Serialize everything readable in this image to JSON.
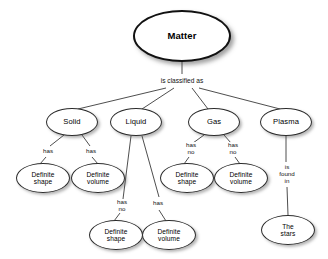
{
  "diagram": {
    "background_color": "#ffffff",
    "node_border_color": "#2b2b2b",
    "text_color": "#000000"
  },
  "nodes": {
    "root": {
      "label": "Matter",
      "cx": 182,
      "cy": 36,
      "rx": 49,
      "ry": 26
    },
    "states": [
      {
        "key": "solid",
        "label": "Solid",
        "cx": 72,
        "cy": 122,
        "rx": 26,
        "ry": 14
      },
      {
        "key": "liquid",
        "label": "Liquid",
        "cx": 136,
        "cy": 122,
        "rx": 26,
        "ry": 14
      },
      {
        "key": "gas",
        "label": "Gas",
        "cx": 214,
        "cy": 122,
        "rx": 26,
        "ry": 14
      },
      {
        "key": "plasma",
        "label": "Plasma",
        "cx": 286,
        "cy": 122,
        "rx": 26,
        "ry": 14
      }
    ],
    "properties": [
      {
        "key": "solid-shape",
        "label": "Definite\nshape",
        "cx": 43,
        "cy": 178,
        "rx": 27,
        "ry": 15
      },
      {
        "key": "solid-volume",
        "label": "Definite\nvolume",
        "cx": 98,
        "cy": 178,
        "rx": 27,
        "ry": 15
      },
      {
        "key": "gas-shape",
        "label": "Definite\nshape",
        "cx": 187,
        "cy": 178,
        "rx": 27,
        "ry": 15
      },
      {
        "key": "gas-volume",
        "label": "Definite\nvolume",
        "cx": 241,
        "cy": 178,
        "rx": 27,
        "ry": 15
      },
      {
        "key": "liquid-shape",
        "label": "Definite\nshape",
        "cx": 116,
        "cy": 235,
        "rx": 27,
        "ry": 15
      },
      {
        "key": "liquid-volume",
        "label": "Definite\nvolume",
        "cx": 169,
        "cy": 235,
        "rx": 27,
        "ry": 15
      },
      {
        "key": "the-stars",
        "label": "The\nstars",
        "cx": 288,
        "cy": 230,
        "rx": 27,
        "ry": 15
      }
    ]
  },
  "edge_labels": [
    {
      "key": "classified",
      "text": "is classified as",
      "x": 182,
      "y": 81
    },
    {
      "key": "solid-has-1",
      "text": "has",
      "x": 48,
      "y": 151
    },
    {
      "key": "solid-has-2",
      "text": "has",
      "x": 91,
      "y": 151
    },
    {
      "key": "gas-hasno-1",
      "text": "has\nno",
      "x": 191,
      "y": 149
    },
    {
      "key": "gas-hasno-2",
      "text": "has\nno",
      "x": 233,
      "y": 149
    },
    {
      "key": "liquid-hasno",
      "text": "has\nno",
      "x": 122,
      "y": 206
    },
    {
      "key": "liquid-has",
      "text": "has",
      "x": 158,
      "y": 203
    },
    {
      "key": "plasma-found",
      "text": "is\nfound\nin",
      "x": 287,
      "y": 174
    }
  ],
  "edges": [
    {
      "from": "root",
      "to": "classified-label",
      "x1": 182,
      "y1": 62,
      "x2": 182,
      "y2": 74
    },
    {
      "from": "classified-label",
      "to": "solid",
      "x1": 166,
      "y1": 88,
      "x2": 78,
      "y2": 109
    },
    {
      "from": "classified-label",
      "to": "liquid",
      "x1": 174,
      "y1": 88,
      "x2": 142,
      "y2": 109
    },
    {
      "from": "classified-label",
      "to": "gas",
      "x1": 192,
      "y1": 88,
      "x2": 208,
      "y2": 109
    },
    {
      "from": "classified-label",
      "to": "plasma",
      "x1": 199,
      "y1": 88,
      "x2": 280,
      "y2": 109
    },
    {
      "from": "solid",
      "to": "solid-has-1",
      "x1": 64,
      "y1": 135,
      "x2": 50,
      "y2": 146
    },
    {
      "from": "solid-has-1",
      "to": "solid-shape",
      "x1": 46,
      "y1": 157,
      "x2": 40,
      "y2": 164
    },
    {
      "from": "solid",
      "to": "solid-has-2",
      "x1": 82,
      "y1": 135,
      "x2": 90,
      "y2": 146
    },
    {
      "from": "solid-has-2",
      "to": "solid-volume",
      "x1": 92,
      "y1": 157,
      "x2": 98,
      "y2": 164
    },
    {
      "from": "gas",
      "to": "gas-hasno-1",
      "x1": 204,
      "y1": 135,
      "x2": 193,
      "y2": 143
    },
    {
      "from": "gas-hasno-1",
      "to": "gas-shape",
      "x1": 189,
      "y1": 157,
      "x2": 184,
      "y2": 164
    },
    {
      "from": "gas",
      "to": "gas-hasno-2",
      "x1": 224,
      "y1": 135,
      "x2": 231,
      "y2": 143
    },
    {
      "from": "gas-hasno-2",
      "to": "gas-volume",
      "x1": 235,
      "y1": 157,
      "x2": 240,
      "y2": 164
    },
    {
      "from": "liquid",
      "to": "liquid-hasno",
      "x1": 131,
      "y1": 136,
      "x2": 123,
      "y2": 199
    },
    {
      "from": "liquid-hasno",
      "to": "liquid-shape",
      "x1": 120,
      "y1": 213,
      "x2": 114,
      "y2": 221
    },
    {
      "from": "liquid",
      "to": "liquid-has",
      "x1": 142,
      "y1": 136,
      "x2": 159,
      "y2": 197
    },
    {
      "from": "liquid-has",
      "to": "liquid-volume",
      "x1": 159,
      "y1": 210,
      "x2": 166,
      "y2": 221
    },
    {
      "from": "plasma",
      "to": "plasma-found",
      "x1": 286,
      "y1": 136,
      "x2": 286,
      "y2": 162
    },
    {
      "from": "plasma-found",
      "to": "the-stars",
      "x1": 287,
      "y1": 187,
      "x2": 288,
      "y2": 215
    }
  ]
}
